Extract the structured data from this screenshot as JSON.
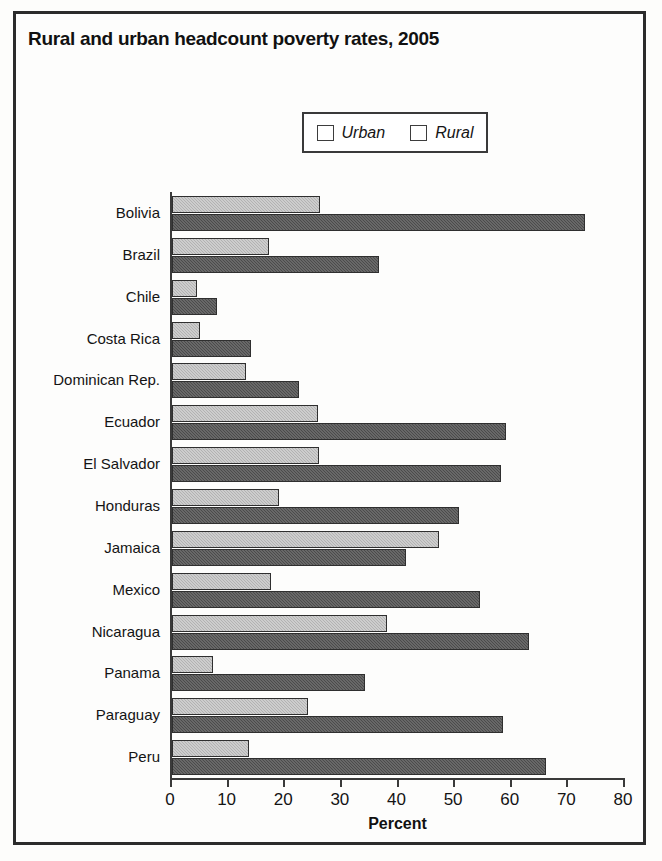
{
  "chart_data": {
    "type": "bar",
    "orientation": "horizontal",
    "title": "Rural and urban headcount poverty rates, 2005",
    "xlabel": "Percent",
    "ylabel": "",
    "xlim": [
      0,
      80
    ],
    "xticks": [
      0,
      10,
      20,
      30,
      40,
      50,
      60,
      70,
      80
    ],
    "grid": false,
    "legend_position": "top-center",
    "categories": [
      "Bolivia",
      "Brazil",
      "Chile",
      "Costa Rica",
      "Dominican Rep.",
      "Ecuador",
      "El Salvador",
      "Honduras",
      "Jamaica",
      "Mexico",
      "Nicaragua",
      "Panama",
      "Paraguay",
      "Peru"
    ],
    "series": [
      {
        "name": "Urban",
        "color": "#b2b2b2",
        "values": [
          26.1,
          17.1,
          4.4,
          5.0,
          13.1,
          25.8,
          26.0,
          18.9,
          47.2,
          17.4,
          38.0,
          7.3,
          24.0,
          13.6
        ]
      },
      {
        "name": "Rural",
        "color": "#4b4b4b",
        "values": [
          73.0,
          36.5,
          8.0,
          14.0,
          22.4,
          59.0,
          58.1,
          50.7,
          41.4,
          54.4,
          63.0,
          34.1,
          58.5,
          66.0
        ]
      }
    ]
  }
}
